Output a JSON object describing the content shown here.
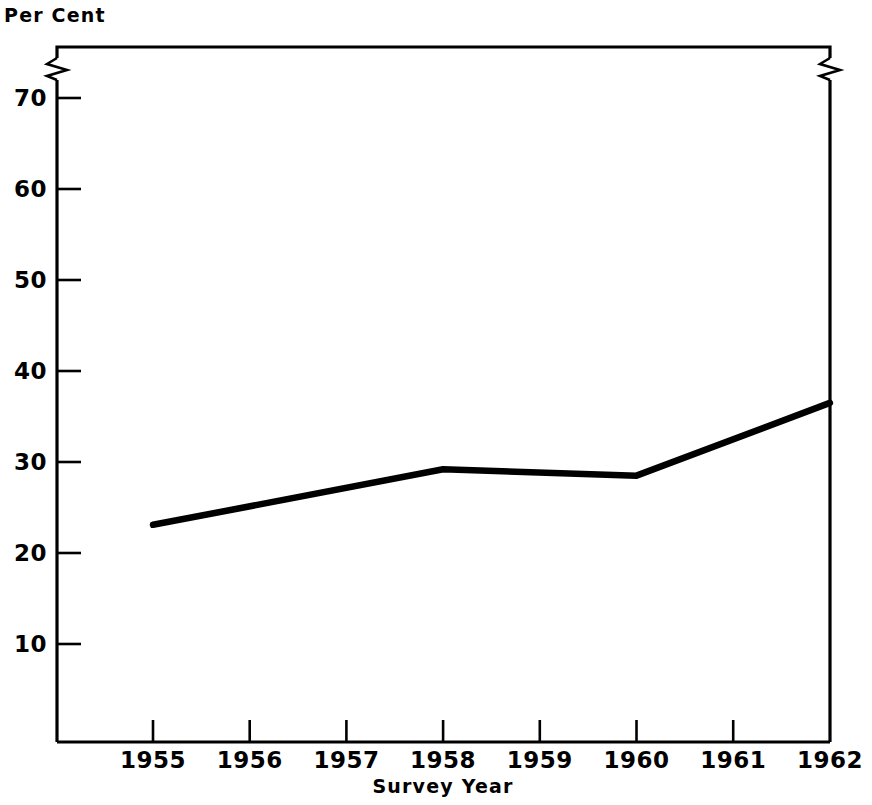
{
  "chart_data": {
    "type": "line",
    "title": "",
    "subtitle": "",
    "xlabel": "Survey Year",
    "ylabel": "Per Cent",
    "x": [
      1955,
      1956,
      1957,
      1958,
      1959,
      1960,
      1961,
      1962
    ],
    "xtick_labels": [
      "1955",
      "1956",
      "1957",
      "1958",
      "1959",
      "1960",
      "1961",
      "1962"
    ],
    "values": [
      23.1,
      25.2,
      27.2,
      29.2,
      28.9,
      28.5,
      32.5,
      36.5
    ],
    "series": [
      {
        "name": "Per Cent",
        "values": [
          23.1,
          25.2,
          27.2,
          29.2,
          28.9,
          28.5,
          32.5,
          36.5
        ]
      }
    ],
    "vertices": [
      {
        "x": 1955,
        "y": 23.1
      },
      {
        "x": 1958,
        "y": 29.2
      },
      {
        "x": 1960,
        "y": 28.5
      },
      {
        "x": 1962,
        "y": 36.5
      }
    ],
    "ytick_labels": [
      "70",
      "60",
      "50",
      "40",
      "30",
      "20",
      "10"
    ],
    "yticks": [
      70,
      60,
      50,
      40,
      30,
      20,
      10
    ],
    "ylim": [
      0,
      76.2
    ],
    "xlim": [
      1954.0,
      1962.0
    ],
    "grid": false,
    "legend": null,
    "axis_break": {
      "present": true,
      "note": "zigzag break on left and right vertical frame edges above the 70 tick"
    },
    "line_color": "#000000",
    "frame_color": "#000000",
    "background_color": "#ffffff"
  }
}
